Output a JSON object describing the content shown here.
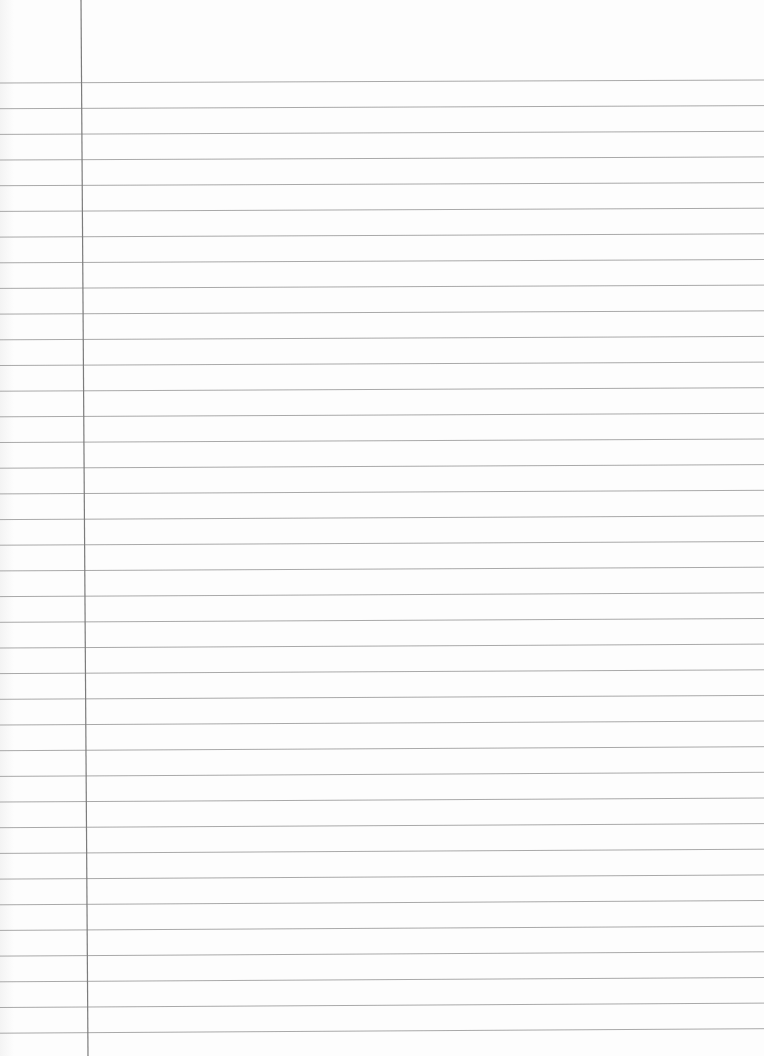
{
  "page": {
    "type": "ruled-notebook-paper",
    "paper_color": "#fdfdfd",
    "rule_color": "#9a9a9a",
    "margin_line_color": "#7c7c7c"
  },
  "rules": {
    "count": 38,
    "first_y_left": 83,
    "first_y_right": 80,
    "spacing": 25.68
  },
  "margin_line": {
    "x_top": 81,
    "x_bottom": 88
  }
}
